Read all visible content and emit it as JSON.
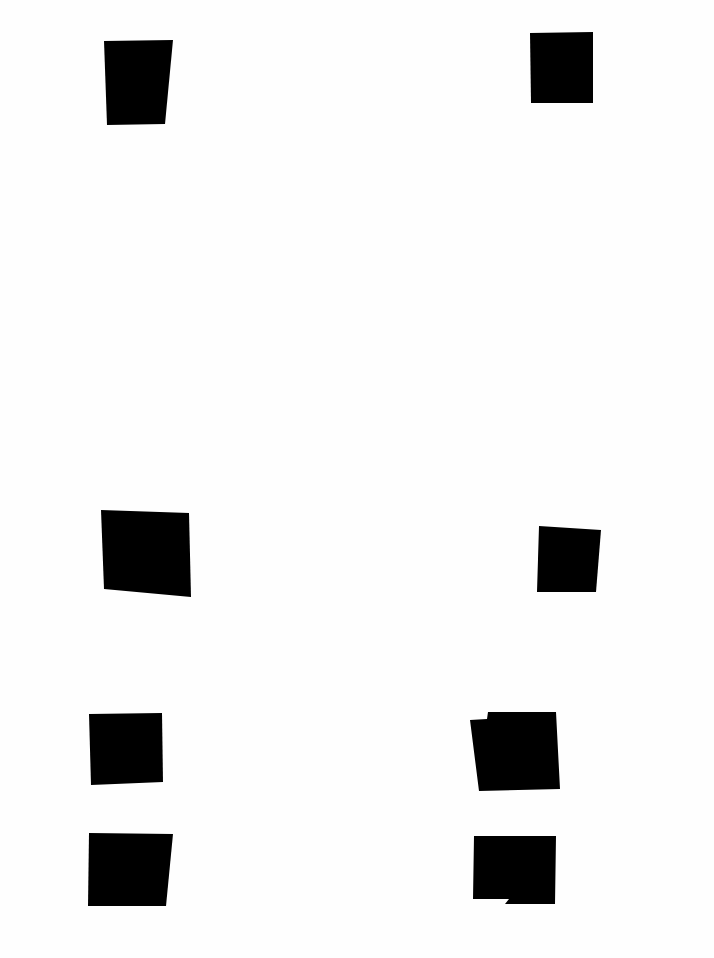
{
  "page": {
    "width": 714,
    "height": 958,
    "background": "#fefefe",
    "block_color": "#000000"
  },
  "blocks": [
    {
      "id": "top-left",
      "points": "104,41 173,40 165,124 107,125"
    },
    {
      "id": "top-right",
      "points": "530,33 593,32 593,103 531,103"
    },
    {
      "id": "middle-left",
      "points": "101,510 189,513 191,597 104,589"
    },
    {
      "id": "middle-right",
      "points": "539,526 601,530 596,592 537,592"
    },
    {
      "id": "lower-left-1",
      "points": "89,714 162,713 163,782 91,785"
    },
    {
      "id": "lower-right-1",
      "points": "470,720 487,719 488,712 556,712 560,789 479,791"
    },
    {
      "id": "lower-left-2",
      "points": "89,833 173,834 166,906 88,906"
    },
    {
      "id": "lower-right-2",
      "points": "474,836 556,836 555,904 505,904 509,899 473,899"
    }
  ]
}
